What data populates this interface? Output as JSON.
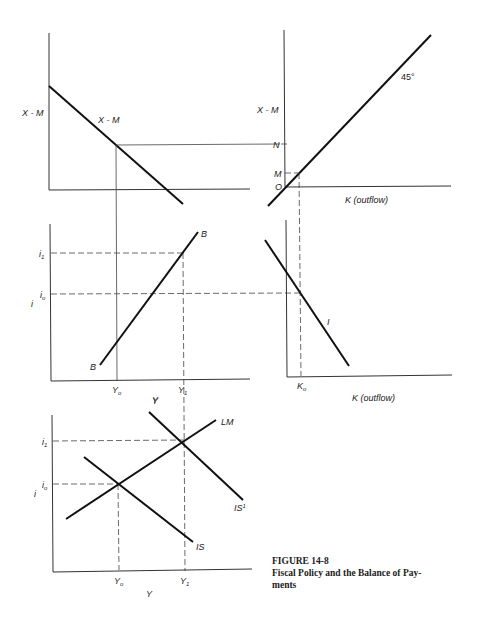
{
  "figure": {
    "number": "FIGURE 14-8",
    "title": "Fiscal Policy and the Balance of Pay-",
    "title_cont": "ments"
  },
  "panels": {
    "trade_balance": {
      "y_label": "X - M",
      "curve_label": "X - M"
    },
    "forty_five": {
      "y_label": "X - M",
      "x_label": "K (outflow)",
      "angle_label": "45°",
      "tick_N": "N",
      "tick_M": "M",
      "origin": "O"
    },
    "bp_curve": {
      "y_label": "i",
      "x_label": "Y",
      "curve_label_top": "B",
      "curve_label_bottom": "B",
      "tick_i1": "i",
      "tick_i1_sub": "1",
      "tick_io": "i",
      "tick_io_sub": "o",
      "tick_Yo": "Y",
      "tick_Yo_sub": "o",
      "tick_Y1": "Y",
      "tick_Y1_sub": "1"
    },
    "capital_flow": {
      "x_label": "K (outflow)",
      "curve_label": "I",
      "tick_Ko": "K",
      "tick_Ko_sub": "o"
    },
    "islm": {
      "y_label": "i",
      "x_label": "Y",
      "top_label": "Y",
      "lm_label": "LM",
      "is_label": "IS",
      "is1_label": "IS",
      "is1_sup": "1",
      "tick_i1": "i",
      "tick_i1_sub": "1",
      "tick_io": "i",
      "tick_io_sub": "o",
      "tick_Yo": "Y",
      "tick_Yo_sub": "o",
      "tick_Y1": "Y",
      "tick_Y1_sub": "1"
    }
  }
}
